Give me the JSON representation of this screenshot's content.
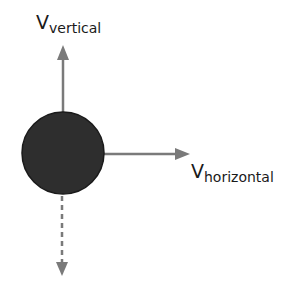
{
  "diagram": {
    "title": "",
    "object": {
      "shape": "circle",
      "fill": "#2e2e2e",
      "stroke": "#1a1a1a",
      "cx": 63,
      "cy": 153,
      "r": 41
    },
    "vectors": [
      {
        "id": "v-vertical",
        "direction": "up",
        "style": "solid",
        "color": "#7a7a7a",
        "label_main": "V",
        "label_sub": "vertical"
      },
      {
        "id": "v-horizontal",
        "direction": "right",
        "style": "solid",
        "color": "#7a7a7a",
        "label_main": "V",
        "label_sub": "horizontal"
      },
      {
        "id": "gravity",
        "direction": "down",
        "style": "dashed",
        "color": "#7a7a7a",
        "label_main": "",
        "label_sub": ""
      }
    ]
  }
}
